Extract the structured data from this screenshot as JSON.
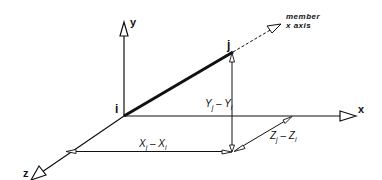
{
  "diagram": {
    "axes": {
      "x": {
        "label": "x"
      },
      "y": {
        "label": "y"
      },
      "z": {
        "label": "z"
      }
    },
    "points": {
      "start": {
        "label": "i"
      },
      "end": {
        "label": "j"
      }
    },
    "member_axis": {
      "line1": "member",
      "line2": "x axis"
    },
    "components": {
      "dx": {
        "var": "X",
        "sub1": "j",
        "op": " – ",
        "sub2": "i"
      },
      "dy": {
        "var": "Y",
        "sub1": "j",
        "op": " – ",
        "sub2": "i"
      },
      "dz": {
        "var": "Z",
        "sub1": "j",
        "op": " – ",
        "sub2": "i"
      }
    },
    "colors": {
      "ink": "#111111",
      "background": "#ffffff"
    }
  }
}
